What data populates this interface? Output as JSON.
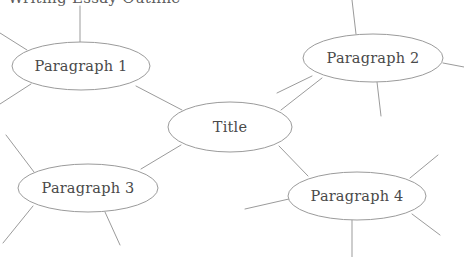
{
  "diagram": {
    "type": "mind-map",
    "background_color": "#ffffff",
    "stroke_color": "#9b9b9b",
    "text_color": "#4a4a4a",
    "width": 464,
    "height": 257,
    "clipped_header_text": "Writing Essay Outline",
    "center_node": {
      "id": "title",
      "label": "Title",
      "cx": 230,
      "cy": 127,
      "rx": 62,
      "ry": 25
    },
    "topic_nodes": [
      {
        "id": "paragraph-1",
        "label": "Paragraph 1",
        "cx": 81,
        "cy": 66,
        "rx": 69,
        "ry": 24
      },
      {
        "id": "paragraph-2",
        "label": "Paragraph 2",
        "cx": 373,
        "cy": 58,
        "rx": 70,
        "ry": 24
      },
      {
        "id": "paragraph-3",
        "label": "Paragraph 3",
        "cx": 88,
        "cy": 188,
        "rx": 70,
        "ry": 24
      },
      {
        "id": "paragraph-4",
        "label": "Paragraph 4",
        "cx": 357,
        "cy": 196,
        "rx": 69,
        "ry": 24
      }
    ],
    "connectors": [
      {
        "id": "title-to-paragraph-1",
        "from": "title",
        "to": "paragraph-1",
        "x1": 182,
        "y1": 110,
        "x2": 136,
        "y2": 86
      },
      {
        "id": "title-to-paragraph-2",
        "from": "title",
        "to": "paragraph-2",
        "x1": 281,
        "y1": 110,
        "x2": 322,
        "y2": 78
      },
      {
        "id": "title-to-paragraph-3",
        "from": "title",
        "to": "paragraph-3",
        "x1": 181,
        "y1": 145,
        "x2": 141,
        "y2": 169
      },
      {
        "id": "title-to-paragraph-4",
        "from": "title",
        "to": "paragraph-4",
        "x1": 279,
        "y1": 146,
        "x2": 308,
        "y2": 176
      }
    ],
    "branches": [
      {
        "id": "branch-p1-top",
        "parent": "paragraph-1",
        "x1": 80,
        "y1": 42,
        "x2": 80,
        "y2": 6
      },
      {
        "id": "branch-p1-upper-left",
        "parent": "paragraph-1",
        "x1": 27,
        "y1": 50,
        "x2": 0,
        "y2": 33
      },
      {
        "id": "branch-p1-lower-left",
        "parent": "paragraph-1",
        "x1": 31,
        "y1": 84,
        "x2": 0,
        "y2": 104
      },
      {
        "id": "branch-p2-top",
        "parent": "paragraph-2",
        "x1": 356,
        "y1": 34,
        "x2": 352,
        "y2": 0
      },
      {
        "id": "branch-p2-right",
        "parent": "paragraph-2",
        "x1": 443,
        "y1": 63,
        "x2": 464,
        "y2": 67
      },
      {
        "id": "branch-p2-bottom",
        "parent": "paragraph-2",
        "x1": 377,
        "y1": 82,
        "x2": 381,
        "y2": 116
      },
      {
        "id": "branch-p2-lower-left",
        "parent": "paragraph-2",
        "x1": 312,
        "y1": 76,
        "x2": 277,
        "y2": 93
      },
      {
        "id": "branch-p3-upper-left",
        "parent": "paragraph-3",
        "x1": 34,
        "y1": 172,
        "x2": 6,
        "y2": 135
      },
      {
        "id": "branch-p3-lower-left",
        "parent": "paragraph-3",
        "x1": 33,
        "y1": 206,
        "x2": 3,
        "y2": 243
      },
      {
        "id": "branch-p3-lower-right",
        "parent": "paragraph-3",
        "x1": 105,
        "y1": 212,
        "x2": 120,
        "y2": 245
      },
      {
        "id": "branch-p4-upper-right",
        "parent": "paragraph-4",
        "x1": 410,
        "y1": 178,
        "x2": 438,
        "y2": 155
      },
      {
        "id": "branch-p4-left",
        "parent": "paragraph-4",
        "x1": 289,
        "y1": 199,
        "x2": 245,
        "y2": 209
      },
      {
        "id": "branch-p4-lower-right",
        "parent": "paragraph-4",
        "x1": 412,
        "y1": 214,
        "x2": 440,
        "y2": 235
      },
      {
        "id": "branch-p4-bottom",
        "parent": "paragraph-4",
        "x1": 352,
        "y1": 220,
        "x2": 352,
        "y2": 257
      }
    ]
  }
}
